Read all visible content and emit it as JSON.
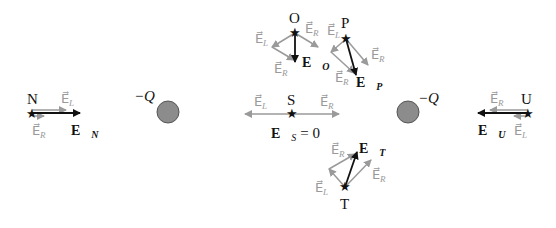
{
  "charges": [
    {
      "label": "−Q",
      "color": "#8c8c8c",
      "position": "left"
    },
    {
      "label": "−Q",
      "color": "#8c8c8c",
      "position": "right"
    }
  ],
  "points": {
    "N": {
      "name": "N",
      "field_left": "E",
      "field_left_sub": "L",
      "field_right": "E",
      "field_right_sub": "R",
      "net": "E",
      "net_sub": "N"
    },
    "O": {
      "name": "O",
      "field_left": "E",
      "field_left_sub": "L",
      "field_right": "E",
      "field_right_sub": "R",
      "field_right2": "E",
      "field_right2_sub": "R",
      "net": "E",
      "net_sub": "O"
    },
    "P": {
      "name": "P",
      "field_left": "E",
      "field_left_sub": "L",
      "field_right": "E",
      "field_right_sub": "R",
      "field_right2": "E",
      "field_right2_sub": "R",
      "net": "E",
      "net_sub": "P"
    },
    "S": {
      "name": "S",
      "field_left": "E",
      "field_left_sub": "L",
      "field_right": "E",
      "field_right_sub": "R",
      "net": "E",
      "net_sub": "S",
      "net_value": "= 0"
    },
    "T": {
      "name": "T",
      "field_left": "E",
      "field_left_sub": "L",
      "field_right": "E",
      "field_right_sub": "R",
      "field_right2": "E",
      "field_right2_sub": "R",
      "net": "E",
      "net_sub": "T"
    },
    "U": {
      "name": "U",
      "field_left": "E",
      "field_left_sub": "L",
      "field_right": "E",
      "field_right_sub": "R",
      "net": "E",
      "net_sub": "U"
    }
  },
  "colors": {
    "net_field": "#111111",
    "component_field": "#9a9a9a",
    "charge_fill": "#8c8c8c"
  },
  "glyphs": {
    "star": "★",
    "vec": "⃗"
  }
}
